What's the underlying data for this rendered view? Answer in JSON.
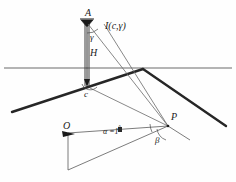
{
  "diagram": {
    "type": "line-diagram",
    "background_color": "#fefefe",
    "ink_color": "#1a1a1a",
    "road_color": "#262626",
    "thin_color": "#555555"
  },
  "labels": {
    "apex": "A",
    "intensity": "I(c,γ)",
    "gamma": "γ",
    "height": "H",
    "c_point": "c",
    "p_point": "P",
    "o_point": "O",
    "alpha_value": "α =",
    "alpha_number": "1",
    "degree_symbol": "°",
    "beta": "β"
  },
  "points": {
    "A": {
      "x": 88,
      "y": 18
    },
    "base": {
      "x": 88,
      "y": 86
    },
    "c": {
      "x": 89,
      "y": 86
    },
    "vertex": {
      "x": 143,
      "y": 69
    },
    "P": {
      "x": 168,
      "y": 126
    },
    "O": {
      "x": 68,
      "y": 133
    },
    "O_bottom": {
      "x": 68,
      "y": 170
    },
    "road_left_end": {
      "x": 12,
      "y": 112
    },
    "road_right_end": {
      "x": 226,
      "y": 126
    }
  },
  "lines": {
    "horizon_y": 68,
    "horizon_x1": 4,
    "horizon_x2": 232
  }
}
